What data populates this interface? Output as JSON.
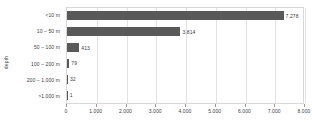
{
  "chart_data": {
    "type": "bar",
    "orientation": "horizontal",
    "title": "",
    "xlabel": "",
    "ylabel": "depth",
    "categories": [
      "<10 m",
      "10 – 50 m",
      "50 – 100 m",
      "100 – 200 m",
      "200 – 1.000 m",
      ">1.000 m"
    ],
    "values": [
      7278,
      3814,
      413,
      79,
      32,
      1
    ],
    "value_labels": [
      "7.278",
      "3.814",
      "413",
      "79",
      "32",
      "1"
    ],
    "xlim": [
      0,
      8000
    ],
    "xticks": [
      0,
      1000,
      2000,
      3000,
      4000,
      5000,
      6000,
      7000,
      8000
    ],
    "xtick_labels": [
      "0",
      "1.000",
      "2.000",
      "3.000",
      "4.000",
      "5.000",
      "6.000",
      "7.000",
      "8.000"
    ],
    "grid": true,
    "grid_axis": "x",
    "legend": false,
    "bar_color": "#595959",
    "gridline_color": "#e3e3e3",
    "axis_color": "#d8d8d8",
    "text_color": "#404040"
  }
}
